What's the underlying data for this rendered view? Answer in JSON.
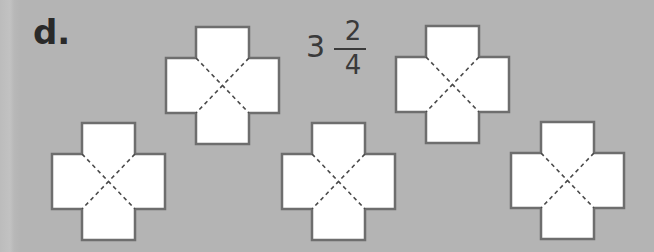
{
  "problem": {
    "label": "d.",
    "mixed_number": {
      "whole": "3",
      "numerator": "2",
      "denominator": "4"
    }
  },
  "shapes": {
    "type": "cross-divided-into-quarters",
    "count": 5,
    "fill": "#ffffff",
    "stroke": "#6e6e6e",
    "dash_stroke": "#4a4a4a"
  },
  "colors": {
    "background": "#b4b4b4",
    "text": "#2a2a2a"
  }
}
